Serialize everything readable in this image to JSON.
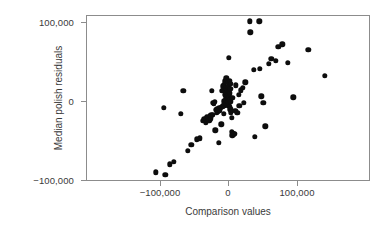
{
  "chart_data": {
    "type": "scatter",
    "title": "",
    "xlabel": "Comparison values",
    "ylabel": "Median polish residuals",
    "xlim": [
      -125000,
      290000
    ],
    "ylim": [
      -110000,
      112000
    ],
    "grid": false,
    "legend": null,
    "xticks": [
      -100000,
      0,
      100000
    ],
    "xticklabels": [
      "−100,000",
      "0",
      "100,000"
    ],
    "yticks": [
      -100000,
      0,
      100000
    ],
    "yticklabels": [
      "100,000",
      "0",
      "−100,000"
    ],
    "marker": {
      "shape": "circle",
      "color": "#0d0d0d",
      "size_px": 5.4
    },
    "n_points": 103,
    "points": [
      [
        -107000,
        -89000
      ],
      [
        -93000,
        -92000
      ],
      [
        -95000,
        -7000
      ],
      [
        -86000,
        -79000
      ],
      [
        -81000,
        -76000
      ],
      [
        -70000,
        -15000
      ],
      [
        -67000,
        14000
      ],
      [
        -60000,
        -62000
      ],
      [
        -55000,
        -54000
      ],
      [
        -47000,
        -47000
      ],
      [
        -43000,
        -46000
      ],
      [
        -38000,
        -24000
      ],
      [
        -36000,
        -22000
      ],
      [
        -34000,
        -26000
      ],
      [
        -33000,
        -21000
      ],
      [
        -32000,
        -19000
      ],
      [
        -31000,
        -24000
      ],
      [
        -30000,
        -20000
      ],
      [
        -29000,
        -23000
      ],
      [
        -28000,
        -18000
      ],
      [
        -27000,
        -21000
      ],
      [
        -26000,
        -17000
      ],
      [
        -25000,
        14000
      ],
      [
        -24000,
        -16000
      ],
      [
        -23000,
        -1000
      ],
      [
        -22000,
        -2000
      ],
      [
        -21000,
        0
      ],
      [
        -20000,
        -36000
      ],
      [
        -19000,
        -10000
      ],
      [
        -18000,
        -14000
      ],
      [
        -17000,
        -9000
      ],
      [
        -16000,
        -12000
      ],
      [
        -15000,
        -52000
      ],
      [
        -14000,
        -8000
      ],
      [
        -13000,
        -11000
      ],
      [
        -12000,
        -7000
      ],
      [
        -11000,
        -28000
      ],
      [
        -10000,
        -6000
      ],
      [
        -10000,
        14000
      ],
      [
        -9000,
        -5000
      ],
      [
        -9000,
        20000
      ],
      [
        -8000,
        -15000
      ],
      [
        -8000,
        22000
      ],
      [
        -7000,
        -4000
      ],
      [
        -7000,
        1000
      ],
      [
        -6000,
        -3000
      ],
      [
        -6000,
        9000
      ],
      [
        -6000,
        26000
      ],
      [
        -5000,
        -2000
      ],
      [
        -5000,
        6000
      ],
      [
        -5000,
        18000
      ],
      [
        -4000,
        -1000
      ],
      [
        -4000,
        3000
      ],
      [
        -4000,
        12000
      ],
      [
        -4000,
        30000
      ],
      [
        -3000,
        0
      ],
      [
        -3000,
        2000
      ],
      [
        -3000,
        7000
      ],
      [
        -3000,
        16000
      ],
      [
        -2000,
        -2000
      ],
      [
        -2000,
        1000
      ],
      [
        -2000,
        5000
      ],
      [
        -2000,
        10000
      ],
      [
        -2000,
        24000
      ],
      [
        -1000,
        -4000
      ],
      [
        -1000,
        0
      ],
      [
        -1000,
        4000
      ],
      [
        -1000,
        8000
      ],
      [
        -1000,
        19000
      ],
      [
        0,
        -3000
      ],
      [
        0,
        1000
      ],
      [
        0,
        6000
      ],
      [
        0,
        13000
      ],
      [
        0,
        56000
      ],
      [
        1000,
        -6000
      ],
      [
        1000,
        2000
      ],
      [
        1000,
        11000
      ],
      [
        1000,
        27000
      ],
      [
        2000,
        -9000
      ],
      [
        2000,
        3000
      ],
      [
        2000,
        17000
      ],
      [
        3000,
        -13000
      ],
      [
        3000,
        0
      ],
      [
        3000,
        23000
      ],
      [
        4000,
        -38000
      ],
      [
        4000,
        -20000
      ],
      [
        5000,
        -42000
      ],
      [
        5000,
        5000
      ],
      [
        6000,
        -41000
      ],
      [
        7000,
        -40000
      ],
      [
        8000,
        -40000
      ],
      [
        9000,
        -11000
      ],
      [
        10000,
        21000
      ],
      [
        12000,
        -14000
      ],
      [
        14000,
        9000
      ],
      [
        15000,
        -5000
      ],
      [
        17000,
        15000
      ],
      [
        20000,
        18000
      ],
      [
        22000,
        -1000
      ],
      [
        24000,
        25000
      ],
      [
        30000,
        102000
      ],
      [
        31000,
        88000
      ],
      [
        36000,
        41000
      ],
      [
        38000,
        -44000
      ],
      [
        44000,
        102000
      ],
      [
        45000,
        42000
      ],
      [
        47000,
        7000
      ],
      [
        50000,
        -1000
      ],
      [
        53000,
        -31000
      ],
      [
        58000,
        48000
      ],
      [
        62000,
        55000
      ],
      [
        68000,
        52000
      ],
      [
        72000,
        70000
      ],
      [
        78000,
        73000
      ],
      [
        86000,
        50000
      ],
      [
        94000,
        6000
      ],
      [
        116000,
        66000
      ],
      [
        140000,
        33000
      ]
    ]
  },
  "axes": {
    "x_title": "Comparison values",
    "y_title": "Median polish residuals",
    "x_tick_labels": [
      "−100,000",
      "0",
      "100,000"
    ],
    "y_tick_labels": [
      "100,000",
      "0",
      "−100,000"
    ]
  }
}
